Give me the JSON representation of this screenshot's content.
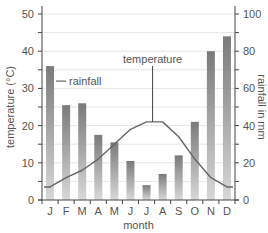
{
  "chart_data": {
    "type": "bar+line",
    "title": "",
    "xlabel": "month",
    "ylabel_left": "temperature (°C)",
    "ylabel_right": "rainfall in mm",
    "categories": [
      "J",
      "F",
      "M",
      "A",
      "M",
      "J",
      "J",
      "A",
      "S",
      "O",
      "N",
      "D"
    ],
    "ylim_left": [
      0,
      50
    ],
    "yticks_left": [
      0,
      10,
      20,
      30,
      40,
      50
    ],
    "ylim_right": [
      0,
      100
    ],
    "yticks_right": [
      0,
      20,
      40,
      60,
      80,
      100
    ],
    "grid": true,
    "series": [
      {
        "name": "rainfall",
        "type": "bar",
        "axis": "right",
        "unit": "mm",
        "values": [
          72,
          51,
          52,
          35,
          31,
          21,
          8,
          14,
          24,
          42,
          80,
          88
        ]
      },
      {
        "name": "temperature",
        "type": "line",
        "axis": "left",
        "unit": "°C",
        "values": [
          3.5,
          6,
          8,
          11,
          15,
          19,
          21,
          21,
          17,
          11,
          6,
          3.5
        ]
      }
    ],
    "annotations": [
      {
        "text": "rainfall",
        "target": "bar J"
      },
      {
        "text": "temperature",
        "target": "line Jul"
      }
    ]
  },
  "colors": {
    "bar_top": "#7a7a7a",
    "bar_bottom": "#d6d6d6",
    "line": "#666666",
    "grid": "#e6e6e6",
    "axis": "#444444",
    "text": "#555555"
  }
}
